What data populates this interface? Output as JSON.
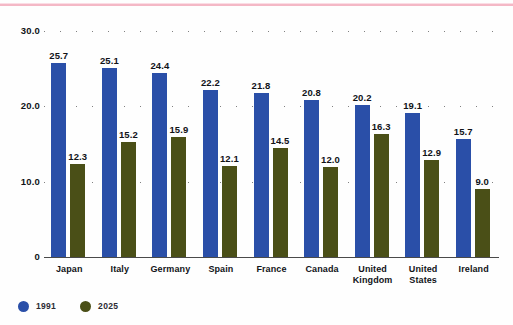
{
  "chart_data": {
    "type": "bar",
    "title": "",
    "subtitle": "",
    "xlabel": "",
    "ylabel": "",
    "ylim": [
      0,
      30
    ],
    "yticks": [
      "30.0",
      "20.0",
      "10.0",
      "0"
    ],
    "ytick_values": [
      30,
      20,
      10,
      0
    ],
    "grid": true,
    "grid_style": "dotted-horizontal",
    "legend_position": "bottom-left",
    "categories": [
      "Japan",
      "Italy",
      "Germany",
      "Spain",
      "France",
      "Canada",
      "United Kingdom",
      "United States",
      "Ireland"
    ],
    "series": [
      {
        "name": "1991",
        "color": "#2a4fa8",
        "values": [
          25.7,
          25.1,
          24.4,
          22.2,
          21.8,
          20.8,
          20.2,
          19.1,
          15.7
        ],
        "labels": [
          "25.7",
          "25.1",
          "24.4",
          "22.2",
          "21.8",
          "20.8",
          "20.2",
          "19.1",
          "15.7"
        ]
      },
      {
        "name": "2025",
        "color": "#4a4f17",
        "values": [
          12.3,
          15.2,
          15.9,
          12.1,
          14.5,
          12.0,
          16.3,
          12.9,
          9.0
        ],
        "labels": [
          "12.3",
          "15.2",
          "15.9",
          "12.1",
          "14.5",
          "12.0",
          "16.3",
          "12.9",
          "9.0"
        ]
      }
    ]
  },
  "legend": {
    "items": [
      {
        "label": "1991",
        "color": "#2a4fa8"
      },
      {
        "label": "2025",
        "color": "#4a4f17"
      }
    ]
  },
  "colors": {
    "series_1991": "#2a4fa8",
    "series_2025": "#4a4f17",
    "top_rule": "#f4b8c6",
    "axis": "#4a4a4a",
    "text": "#111318",
    "background": "#fefefe"
  }
}
